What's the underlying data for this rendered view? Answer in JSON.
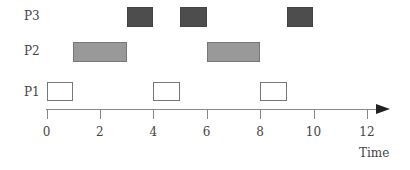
{
  "chart_data": {
    "type": "gantt",
    "title": "",
    "xlabel": "Time",
    "ylabel": "",
    "xlim": [
      0,
      13
    ],
    "xticks": [
      0,
      2,
      4,
      6,
      8,
      10,
      12
    ],
    "xtick_labels": [
      "0",
      "2",
      "4",
      "6",
      "8",
      "10",
      "12"
    ],
    "rows": [
      {
        "name": "P3",
        "fill": "#4d4d4d",
        "intervals": [
          [
            3,
            4
          ],
          [
            5,
            6
          ],
          [
            9,
            10
          ]
        ]
      },
      {
        "name": "P2",
        "fill": "#999999",
        "intervals": [
          [
            1,
            3
          ],
          [
            6,
            8
          ]
        ]
      },
      {
        "name": "P1",
        "fill": "#ffffff",
        "intervals": [
          [
            0,
            1
          ],
          [
            4,
            5
          ],
          [
            8,
            9
          ]
        ]
      }
    ],
    "axis_arrow": true,
    "grid": false
  },
  "labels": {
    "p3": "P3",
    "p2": "P2",
    "p1": "P1"
  },
  "axis": {
    "ticks": [
      "0",
      "2",
      "4",
      "6",
      "8",
      "10",
      "12"
    ],
    "xlabel": "Time"
  }
}
